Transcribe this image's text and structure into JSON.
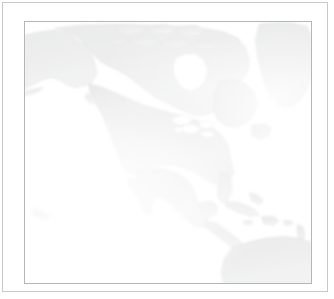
{
  "window": {
    "title": "North America Map",
    "background_color": "#ffffff",
    "outer_border_color": "#c9c9c9"
  },
  "map": {
    "name": "north-america-reference-map",
    "projection_hint": "equirectangular",
    "frame_border_color": "#b4b6b5",
    "water_color": "#ffffff",
    "land_fill_color": "#e3e4e3",
    "coastline_color": "#d0d2d1",
    "has_labels": false,
    "has_graticule": false,
    "has_legend": false,
    "has_scale_bar": false,
    "viewport": {
      "west_longitude": -172,
      "east_longitude": -48,
      "north_latitude": 80,
      "south_latitude": 2
    },
    "features": [
      {
        "id": "alaska",
        "label": "Alaska",
        "kind": "landmass"
      },
      {
        "id": "canada-mainland",
        "label": "Canada",
        "kind": "landmass"
      },
      {
        "id": "arctic-archipelago",
        "label": "Canadian Arctic Archipelago",
        "kind": "islands"
      },
      {
        "id": "greenland",
        "label": "Greenland",
        "kind": "landmass"
      },
      {
        "id": "hudson-bay",
        "label": "Hudson Bay",
        "kind": "water-body"
      },
      {
        "id": "great-lakes",
        "label": "Great Lakes",
        "kind": "water-body"
      },
      {
        "id": "united-states",
        "label": "United States",
        "kind": "landmass"
      },
      {
        "id": "baja-california",
        "label": "Baja California",
        "kind": "peninsula"
      },
      {
        "id": "mexico",
        "label": "Mexico",
        "kind": "landmass"
      },
      {
        "id": "gulf-of-mexico",
        "label": "Gulf of Mexico",
        "kind": "water-body"
      },
      {
        "id": "florida",
        "label": "Florida",
        "kind": "peninsula"
      },
      {
        "id": "central-america",
        "label": "Central America",
        "kind": "landmass"
      },
      {
        "id": "cuba",
        "label": "Cuba",
        "kind": "island"
      },
      {
        "id": "hispaniola",
        "label": "Hispaniola",
        "kind": "island"
      },
      {
        "id": "lesser-antilles",
        "label": "Lesser Antilles",
        "kind": "islands"
      },
      {
        "id": "south-america-north",
        "label": "Northern South America",
        "kind": "landmass"
      },
      {
        "id": "hawaii",
        "label": "Hawaii",
        "kind": "islands"
      },
      {
        "id": "newfoundland",
        "label": "Newfoundland",
        "kind": "island"
      },
      {
        "id": "vancouver-island",
        "label": "Vancouver Island",
        "kind": "island"
      }
    ]
  }
}
